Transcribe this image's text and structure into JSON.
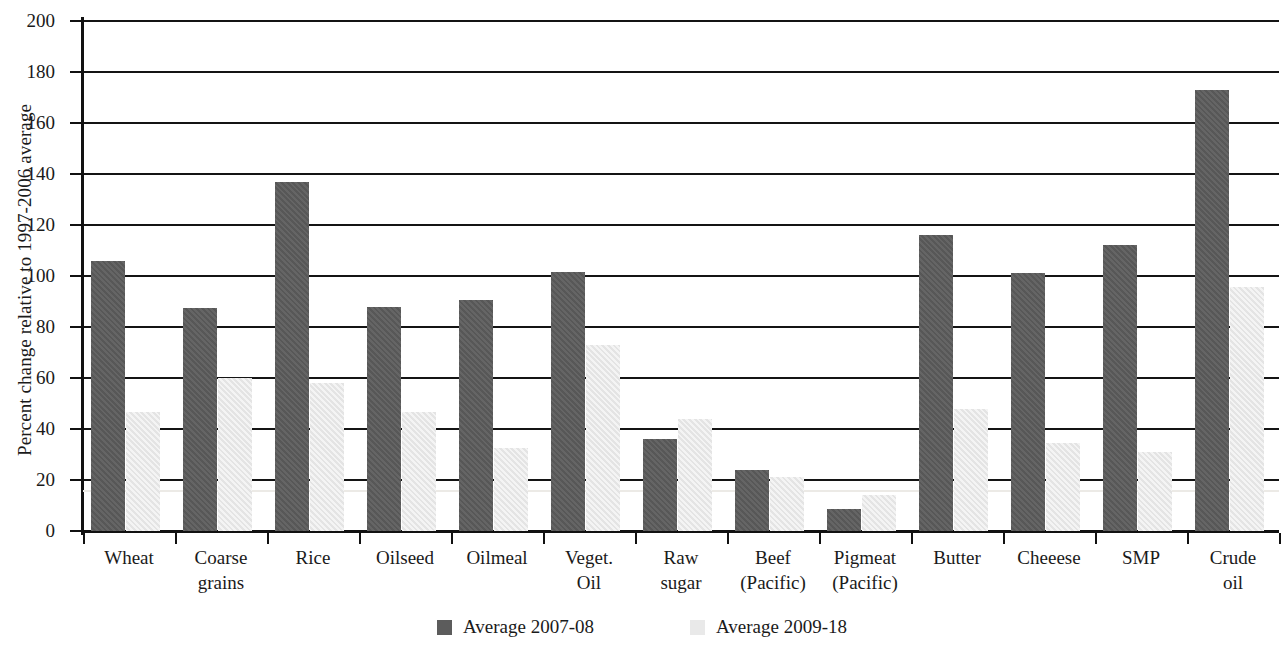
{
  "chart_data": {
    "type": "bar",
    "title": "",
    "xlabel": "",
    "ylabel": "Percent change relative to 1997-2006 average",
    "ylim": [
      0,
      200
    ],
    "ytick_step": 20,
    "grid": true,
    "legend_position": "bottom",
    "categories": [
      "Wheat",
      "Coarse grains",
      "Rice",
      "Oilseed",
      "Oilmeal",
      "Veget. Oil",
      "Raw sugar",
      "Beef (Pacific)",
      "Pigmeat (Pacific)",
      "Butter",
      "Cheeese",
      "SMP",
      "Crude oil"
    ],
    "category_lines": [
      [
        "Wheat",
        ""
      ],
      [
        "Coarse",
        "grains"
      ],
      [
        "Rice",
        ""
      ],
      [
        "Oilseed",
        ""
      ],
      [
        "Oilmeal",
        ""
      ],
      [
        "Veget.",
        "Oil"
      ],
      [
        "Raw",
        "sugar"
      ],
      [
        "Beef",
        "(Pacific)"
      ],
      [
        "Pigmeat",
        "(Pacific)"
      ],
      [
        "Butter",
        ""
      ],
      [
        "Cheeese",
        ""
      ],
      [
        "SMP",
        ""
      ],
      [
        "Crude",
        "oil"
      ]
    ],
    "ytick_labels": [
      "0",
      "20",
      "40",
      "60",
      "80",
      "100",
      "120",
      "140",
      "160",
      "180",
      "200"
    ],
    "ytick_values": [
      0,
      20,
      40,
      60,
      80,
      100,
      120,
      140,
      160,
      180,
      200
    ],
    "series": [
      {
        "name": "Average 2007-08",
        "color": "#5c5c5c",
        "values": [
          106,
          87.5,
          137,
          88,
          90.5,
          101.5,
          36,
          24,
          8.5,
          116,
          101,
          112,
          173
        ]
      },
      {
        "name": "Average 2009-18",
        "color": "#e9e9e9",
        "values": [
          46.5,
          60,
          58,
          46.5,
          32.5,
          73,
          44,
          21,
          14,
          48,
          34.5,
          31,
          95.5
        ]
      }
    ]
  },
  "legend": {
    "entries": [
      {
        "label": "Average 2007-08",
        "swatch": "dark"
      },
      {
        "label": "Average 2009-18",
        "swatch": "light"
      }
    ]
  }
}
